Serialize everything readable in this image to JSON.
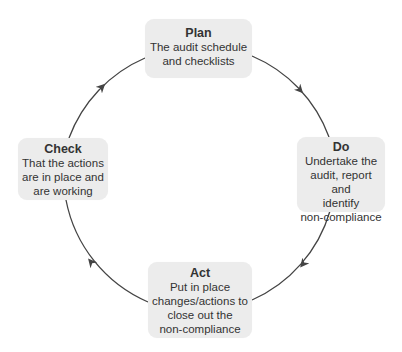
{
  "diagram": {
    "type": "cycle",
    "colors": {
      "box_fill": "#ececec",
      "line": "#444444",
      "text": "#333333"
    },
    "stages": [
      {
        "title": "Plan",
        "lines": [
          "The audit schedule",
          "and checklists"
        ]
      },
      {
        "title": "Do",
        "lines": [
          "Undertake the",
          "audit, report and",
          "identify",
          "non-compliance"
        ]
      },
      {
        "title": "Act",
        "lines": [
          "Put in place",
          "changes/actions to",
          "close out the",
          "non-compliance"
        ]
      },
      {
        "title": "Check",
        "lines": [
          "That the actions",
          "are in place and",
          "are working"
        ]
      }
    ],
    "flow": [
      "Plan",
      "Do",
      "Act",
      "Check",
      "Plan"
    ]
  }
}
